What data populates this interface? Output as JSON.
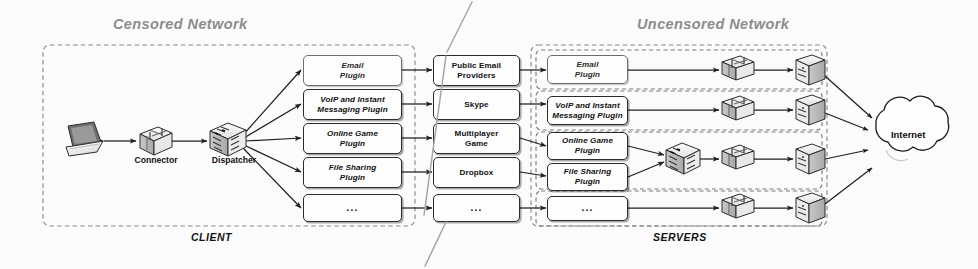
{
  "figure": {
    "type": "network-architecture-diagram",
    "background_color": "#fcfcfc",
    "line_color": "#2b2b2b",
    "region_label_color": "#8d8d8d"
  },
  "regions": {
    "censored": {
      "title": "Censored Network",
      "footer": "CLIENT"
    },
    "uncensored": {
      "title": "Uncensored Network",
      "footer": "SERVERS"
    }
  },
  "client": {
    "devices": [
      {
        "name": "laptop",
        "icon": "laptop-icon",
        "label": ""
      },
      {
        "name": "connector",
        "icon": "connector-icon",
        "label": "Connector"
      },
      {
        "name": "dispatcher",
        "icon": "dispatcher-icon",
        "label": "Dispatcher"
      }
    ],
    "plugins": [
      {
        "label": "Email\nPlugin",
        "lines": [
          "Email",
          "Plugin"
        ]
      },
      {
        "label": "VoIP and Instant\nMessaging Plugin",
        "lines": [
          "VoIP and Instant",
          "Messaging Plugin"
        ]
      },
      {
        "label": "Online Game\nPlugin",
        "lines": [
          "Online Game",
          "Plugin"
        ]
      },
      {
        "label": "File Sharing\nPlugin",
        "lines": [
          "File Sharing",
          "Plugin"
        ]
      },
      {
        "label": "...",
        "lines": [
          "..."
        ]
      }
    ]
  },
  "services": [
    {
      "lines": [
        "Public Email",
        "Providers"
      ]
    },
    {
      "lines": [
        "Skype"
      ]
    },
    {
      "lines": [
        "Multiplayer",
        "Game"
      ]
    },
    {
      "lines": [
        "Dropbox"
      ]
    },
    {
      "lines": [
        "..."
      ]
    }
  ],
  "servers": {
    "groups": [
      {
        "plugins": [
          {
            "lines": [
              "Email",
              "Plugin"
            ]
          }
        ],
        "has_dispatcher": false,
        "icons": [
          "connector-icon",
          "server-icon"
        ]
      },
      {
        "plugins": [
          {
            "lines": [
              "VoIP and Instant",
              "Messaging Plugin"
            ]
          }
        ],
        "has_dispatcher": false,
        "icons": [
          "connector-icon",
          "server-icon"
        ]
      },
      {
        "plugins": [
          {
            "lines": [
              "Online Game",
              "Plugin"
            ]
          },
          {
            "lines": [
              "File Sharing",
              "Plugin"
            ]
          }
        ],
        "has_dispatcher": true,
        "icons": [
          "dispatcher-icon",
          "connector-icon",
          "server-icon"
        ]
      },
      {
        "plugins": [
          {
            "lines": [
              "..."
            ]
          }
        ],
        "has_dispatcher": false,
        "icons": [
          "connector-icon",
          "server-icon"
        ]
      }
    ]
  },
  "internet": {
    "label": "Internet",
    "icon": "cloud-icon"
  }
}
